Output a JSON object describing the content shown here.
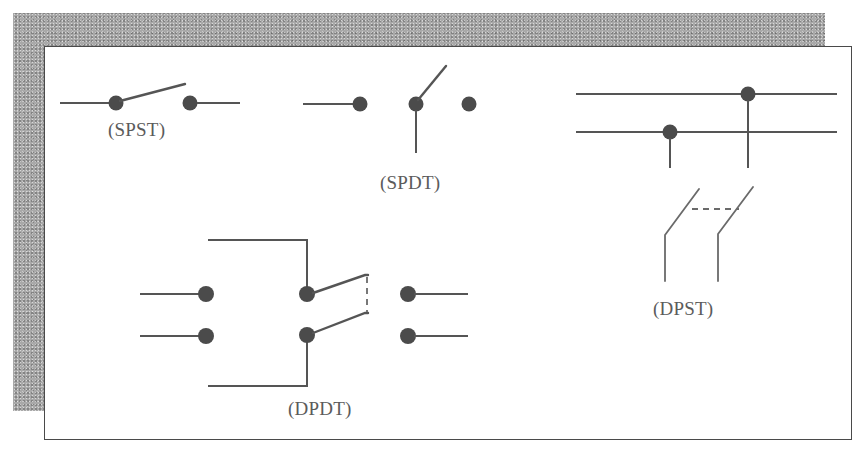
{
  "figure": {
    "canvas": {
      "width": 866,
      "height": 459
    },
    "colors": {
      "page_background": "#ffffff",
      "card_background": "#ffffff",
      "card_border": "#4a4a4a",
      "backing_plate": "#a9a9a9",
      "wire": "#555555",
      "terminal_dot": "#4b4b4b",
      "caption_text": "#5b5b5b"
    }
  },
  "symbols": {
    "spst": {
      "caption": "(SPST)",
      "name": "single-pole-single-throw",
      "terminals": 2,
      "state": "open"
    },
    "spdt": {
      "caption": "(SPDT)",
      "name": "single-pole-double-throw",
      "terminals": 3,
      "state": "thrown-up"
    },
    "dpst": {
      "caption": "(DPST)",
      "name": "double-pole-single-throw",
      "terminals": 4,
      "state": "open-ganged"
    },
    "dpdt": {
      "caption": "(DPDT)",
      "name": "double-pole-double-throw",
      "terminals": 6,
      "state": "thrown-up-ganged"
    }
  }
}
